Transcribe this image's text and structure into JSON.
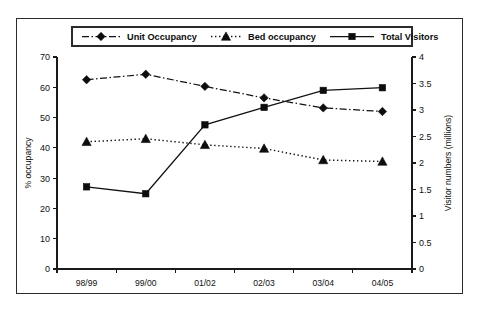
{
  "chart_data": {
    "type": "line",
    "title": "",
    "categories": [
      "98/99",
      "99/00",
      "01/02",
      "02/03",
      "03/04",
      "04/05"
    ],
    "xlabel": "",
    "ylabel": "% occupancy",
    "ylabel_secondary": "Visitor numbers (millions)",
    "ylim": [
      0,
      70
    ],
    "yticks": [
      0,
      10,
      20,
      30,
      40,
      50,
      60,
      70
    ],
    "ylim_secondary": [
      0,
      4
    ],
    "yticks_secondary": [
      "0",
      "0.5",
      "1",
      "1.5",
      "2",
      "2.5",
      "3",
      "3.5",
      "4"
    ],
    "ytick_values_secondary": [
      0,
      0.5,
      1,
      1.5,
      2,
      2.5,
      3,
      3.5,
      4
    ],
    "grid": false,
    "legend_position": "top",
    "series": [
      {
        "name": "Unit Occupancy",
        "axis": "left",
        "marker": "diamond",
        "line_style": "dash-dot",
        "color": "#0d0d0d",
        "values": [
          62.5,
          64.3,
          60.3,
          56.5,
          53.2,
          52.0
        ]
      },
      {
        "name": "Bed occupancy",
        "axis": "left",
        "marker": "triangle",
        "line_style": "dotted",
        "color": "#0d0d0d",
        "values": [
          42.0,
          43.0,
          41.0,
          39.8,
          36.0,
          35.5
        ]
      },
      {
        "name": "Total Visitors",
        "axis": "right",
        "marker": "square",
        "line_style": "solid",
        "color": "#0d0d0d",
        "values": [
          1.55,
          1.42,
          2.72,
          3.05,
          3.37,
          3.42
        ]
      }
    ]
  }
}
